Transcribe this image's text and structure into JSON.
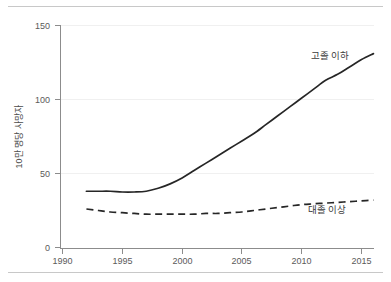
{
  "chart_data": {
    "type": "line",
    "title": "",
    "xlabel": "",
    "ylabel": "10만 명당 사망자",
    "xlim": [
      1990,
      2016.5
    ],
    "ylim": [
      0,
      150
    ],
    "xticks": [
      "1990",
      "1995",
      "2000",
      "2005",
      "2010",
      "2015"
    ],
    "xtick_values": [
      1990,
      1995,
      2000,
      2005,
      2010,
      2015
    ],
    "yticks": [
      "0",
      "50",
      "100",
      "150"
    ],
    "ytick_values": [
      0,
      50,
      100,
      150
    ],
    "grid": "faint-horizontal",
    "legend_position": "inline-annotation",
    "x": [
      1992,
      1993,
      1994,
      1995,
      1996,
      1997,
      1998,
      1999,
      2000,
      2001,
      2002,
      2003,
      2004,
      2005,
      2006,
      2007,
      2008,
      2009,
      2010,
      2011,
      2012,
      2013,
      2014,
      2015,
      2016
    ],
    "series": [
      {
        "name": "고졸 이하",
        "style": "solid",
        "color": "#262626",
        "label_text": "고졸 이하",
        "values": [
          38,
          38,
          38,
          37.5,
          37.5,
          38,
          40,
          43,
          47,
          52,
          57,
          62,
          67,
          72,
          77,
          83,
          89,
          95,
          101,
          107,
          113,
          117,
          122,
          127,
          131
        ]
      },
      {
        "name": "대졸 이상",
        "style": "dashed",
        "color": "#262626",
        "label_text": "대졸 이상",
        "values": [
          26,
          25,
          24,
          23.5,
          23,
          22.5,
          22.5,
          22.5,
          22.5,
          22.5,
          23,
          23,
          23.5,
          24,
          25,
          26,
          27,
          28,
          29,
          29.5,
          30,
          30.5,
          31,
          31.5,
          32
        ]
      }
    ]
  },
  "annotations": {
    "series_label_high_school": "고졸 이하",
    "series_label_college": "대졸 이상"
  },
  "colors": {
    "line": "#262626",
    "axis": "#8c8c8c",
    "tick_text": "#5a5a5a",
    "grid": "#f0f0f0",
    "rule": "#c8c8c8"
  }
}
